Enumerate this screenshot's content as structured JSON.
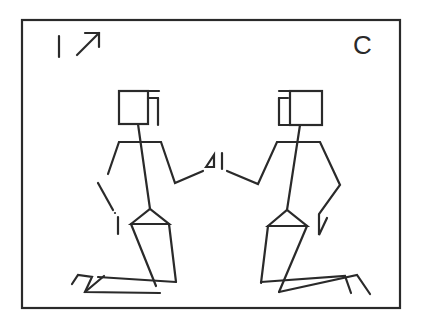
{
  "figure": {
    "label_left": "1",
    "label_right": "C",
    "arrow_icon": "north-east-arrow",
    "center_marks": "∆1",
    "ink_color": "#2a2a2a",
    "background": "#ffffff"
  }
}
